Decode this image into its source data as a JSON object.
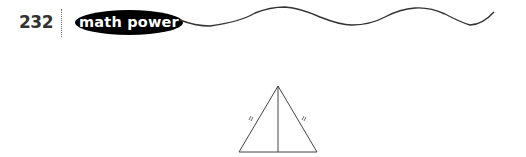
{
  "header": {
    "page_number": "232",
    "section_badge": "math power"
  },
  "figure": {
    "shape": "isosceles-triangle-with-altitude",
    "side_marks": [
      "single tick",
      "single tick"
    ],
    "stroke_color": "#333333"
  },
  "colors": {
    "badge_bg": "#000000",
    "badge_text": "#ffffff",
    "wave": "#333333"
  }
}
